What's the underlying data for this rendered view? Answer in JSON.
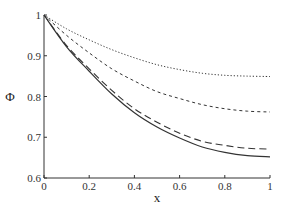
{
  "chart_data": {
    "type": "line",
    "title": "",
    "xlabel": "x",
    "ylabel": "Φ",
    "xlim": [
      0,
      1
    ],
    "ylim": [
      0.6,
      1
    ],
    "grid": false,
    "legend": null,
    "xticks": [
      "0",
      "0.2",
      "0.4",
      "0.6",
      "0.8",
      "1"
    ],
    "yticks": [
      "0.6",
      "0.7",
      "0.8",
      "0.9",
      "1"
    ],
    "x": [
      0,
      0.1,
      0.2,
      0.3,
      0.4,
      0.5,
      0.6,
      0.7,
      0.8,
      0.9,
      1.0
    ],
    "series": [
      {
        "name": "dotted",
        "style": "dotted",
        "values": [
          1.0,
          0.966,
          0.939,
          0.915,
          0.895,
          0.878,
          0.866,
          0.857,
          0.852,
          0.85,
          0.849
        ]
      },
      {
        "name": "short-dashed",
        "style": "short-dash",
        "values": [
          1.0,
          0.95,
          0.907,
          0.868,
          0.838,
          0.812,
          0.795,
          0.78,
          0.77,
          0.764,
          0.762
        ]
      },
      {
        "name": "long-dashed",
        "style": "long-dash",
        "values": [
          1.0,
          0.925,
          0.868,
          0.815,
          0.77,
          0.737,
          0.71,
          0.69,
          0.68,
          0.673,
          0.671
        ]
      },
      {
        "name": "solid",
        "style": "solid",
        "values": [
          1.0,
          0.922,
          0.862,
          0.806,
          0.76,
          0.725,
          0.698,
          0.676,
          0.663,
          0.655,
          0.652
        ]
      }
    ]
  }
}
